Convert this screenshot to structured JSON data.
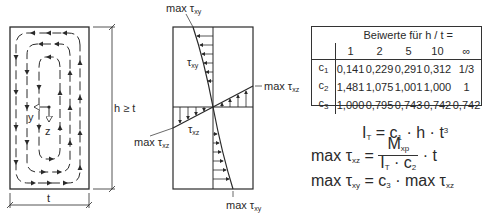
{
  "figure": {
    "left_section": {
      "title": "Shear flow in rectangular cross-section",
      "axis_y_label": "y",
      "axis_z_label": "z",
      "dimension_height": "h ≥ t",
      "dimension_width": "t"
    },
    "middle_section": {
      "label_top": "max τ",
      "label_top_sub": "xy",
      "label_curve": "τ",
      "label_curve_sub": "xy",
      "label_right": "max τ",
      "label_right_sub": "xz",
      "label_left": "max τ",
      "label_left_sub": "xz",
      "label_line": "τ",
      "label_line_sub": "xz",
      "label_bottom": "max τ",
      "label_bottom_sub": "xy"
    },
    "table": {
      "header_title": "Beiwerte für h / t =",
      "columns": [
        "1",
        "2",
        "5",
        "10",
        "∞"
      ],
      "rows": [
        {
          "label": "c",
          "sub": "1",
          "values": [
            "0,141",
            "0,229",
            "0,291",
            "0,312",
            "1/3"
          ]
        },
        {
          "label": "c",
          "sub": "2",
          "values": [
            "1,481",
            "1,075",
            "1,001",
            "1,000",
            "1"
          ]
        },
        {
          "label": "c",
          "sub": "3",
          "values": [
            "1,000",
            "0,795",
            "0,743",
            "0,742",
            "0,742"
          ]
        }
      ]
    },
    "formulas": {
      "f1_lhs": "I",
      "f1_lhs_sub": "T",
      "f1_rhs": "= c",
      "f1_rhs_sub": "1",
      "f1_rest": "· h · t",
      "f1_sup": "3",
      "f2_lhs": "max τ",
      "f2_lhs_sub": "xz",
      "f2_eq": "=",
      "f2_num": "M",
      "f2_num_sub": "xp",
      "f2_den": "I",
      "f2_den_sub": "T",
      "f2_den_mid": "· c",
      "f2_den_sub2": "2",
      "f2_tail": "· t",
      "f3_lhs": "max τ",
      "f3_lhs_sub": "xy",
      "f3_eq": "= c",
      "f3_eq_sub": "3",
      "f3_rest": "· max τ",
      "f3_rest_sub": "xz"
    }
  }
}
